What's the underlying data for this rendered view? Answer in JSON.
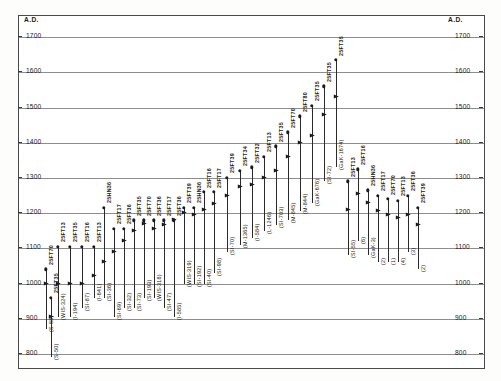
{
  "axes": {
    "left_title": "A.D.",
    "right_title": "A.D.",
    "ticks": [
      1700,
      1600,
      1500,
      1400,
      1300,
      1200,
      1100,
      1000,
      900,
      800
    ],
    "ylim": [
      760,
      1760
    ],
    "grid": true
  },
  "chart_data": {
    "type": "scatter",
    "title": "",
    "xlabel": "",
    "ylabel": "A.D.",
    "ylim": [
      760,
      1760
    ],
    "grid": true,
    "legend": "none",
    "categories": [
      "25FT70",
      "25FT13",
      "25FT35",
      "25FT16",
      "25FT13",
      "25HN36",
      "25FT17",
      "25FT36",
      "25FT35",
      "25FT70",
      "25FT36",
      "25FT17",
      "25FT36",
      "25FT39",
      "25HN36",
      "25FT16",
      "25FT17",
      "25FT39",
      "25FT34",
      "25FT32",
      "25FT13",
      "25FT35",
      "25FT70",
      "25FT80",
      "25FT35",
      "25FT35",
      "25FT35",
      "25FT13",
      "25FT16",
      "25HN36",
      "25FT17",
      "25FT70",
      "25FT13",
      "25FT36",
      "25FT39"
    ],
    "series": [
      {
        "name": "radiocarbon date ranges",
        "points": [
          {
            "site": "25FT70",
            "lab": "(S-68)",
            "low": 870,
            "high": 1040,
            "mean": 1000
          },
          {
            "site": "25FT13",
            "lab": "(WIS-324)",
            "low": 905,
            "high": 1105,
            "mean": 1000
          },
          {
            "site": "25FT35",
            "lab": "(I-194)",
            "low": 905,
            "high": 1105,
            "mean": 1000
          },
          {
            "site": "25FT16",
            "lab": "(SI-87)",
            "low": 930,
            "high": 1105,
            "mean": 1000
          },
          {
            "site": "25FT13",
            "lab": "(I-641)",
            "low": 960,
            "high": 1105,
            "mean": 1020
          },
          {
            "site": "25HN36",
            "lab": "(SI-36)",
            "low": 960,
            "high": 1215,
            "mean": 1060
          },
          {
            "site": "25FT17",
            "lab": "(SI-69)",
            "low": 905,
            "high": 1155,
            "mean": 1090
          },
          {
            "site": "25FT36",
            "lab": "(SI-32)",
            "low": 930,
            "high": 1155,
            "mean": 1120
          },
          {
            "site": "25FT35",
            "lab": "(SI-73)",
            "low": 930,
            "high": 1180,
            "mean": 1150
          },
          {
            "site": "25FT70",
            "lab": "(SI-193)",
            "low": 960,
            "high": 1180,
            "mean": 1170
          },
          {
            "site": "25FT36",
            "lab": "(WIS-318)",
            "low": 960,
            "high": 1180,
            "mean": 1155
          },
          {
            "site": "25FT17",
            "lab": "(SI-47)",
            "low": 930,
            "high": 1180,
            "mean": 1165
          },
          {
            "site": "25FT36",
            "lab": "(I-585)",
            "low": 905,
            "high": 1180,
            "mean": 1180
          },
          {
            "site": "25FT39",
            "lab": "(WIS-319)",
            "low": 1000,
            "high": 1215,
            "mean": 1200
          },
          {
            "site": "25HN36",
            "lab": "(SI-192)",
            "low": 1000,
            "high": 1215,
            "mean": 1195
          },
          {
            "site": "25FT16",
            "lab": "(SI-40)",
            "low": 1000,
            "high": 1260,
            "mean": 1210
          },
          {
            "site": "25FT17",
            "lab": "(SI-98)",
            "low": 1030,
            "high": 1260,
            "mean": 1225
          },
          {
            "site": "25FT39",
            "lab": "(SI-70)",
            "low": 1090,
            "high": 1300,
            "mean": 1250
          },
          {
            "site": "25FT34",
            "lab": "(M-1365)",
            "low": 1110,
            "high": 1320,
            "mean": 1275
          },
          {
            "site": "25FT32",
            "lab": "(I-584)",
            "low": 1130,
            "high": 1330,
            "mean": 1280
          },
          {
            "site": "25FT13",
            "lab": "(L-1246)",
            "low": 1150,
            "high": 1360,
            "mean": 1300
          },
          {
            "site": "25FT35",
            "lab": "(SI-703)",
            "low": 1165,
            "high": 1390,
            "mean": 1320
          },
          {
            "site": "25FT70",
            "lab": "(M-845)",
            "low": 1180,
            "high": 1430,
            "mean": 1360
          },
          {
            "site": "25FT80",
            "lab": "(M-844)",
            "low": 1205,
            "high": 1475,
            "mean": 1400
          },
          {
            "site": "25FT35",
            "lab": "(GaK-676)",
            "low": 1230,
            "high": 1505,
            "mean": 1420
          },
          {
            "site": "25FT35",
            "lab": "(SI-72)",
            "low": 1290,
            "high": 1560,
            "mean": 1480
          },
          {
            "site": "25FT35",
            "lab": "(GaK-1674)",
            "low": 1330,
            "high": 1635,
            "mean": 1530
          },
          {
            "site": "25FT13",
            "lab": "(SI-55)",
            "low": 1080,
            "high": 1290,
            "mean": 1210
          },
          {
            "site": "25FT16",
            "lab": "(6)",
            "low": 1120,
            "high": 1325,
            "mean": 1255
          },
          {
            "site": "25HN36",
            "lab": "(GaK-3)",
            "low": 1080,
            "high": 1265,
            "mean": 1230
          },
          {
            "site": "25FT17",
            "lab": "(2)",
            "low": 1060,
            "high": 1250,
            "mean": 1205
          },
          {
            "site": "25FT70",
            "lab": "(1)",
            "low": 1060,
            "high": 1240,
            "mean": 1195
          },
          {
            "site": "25FT13",
            "lab": "(4)",
            "low": 1060,
            "high": 1235,
            "mean": 1185
          },
          {
            "site": "25FT36",
            "lab": "(3)",
            "low": 1090,
            "high": 1250,
            "mean": 1195
          },
          {
            "site": "25FT39",
            "lab": "(2)",
            "low": 1040,
            "high": 1215,
            "mean": 1165
          },
          {
            "site": "25FT35",
            "lab": "(S-50)",
            "low": 790,
            "high": 960,
            "mean": 905
          }
        ]
      }
    ]
  }
}
